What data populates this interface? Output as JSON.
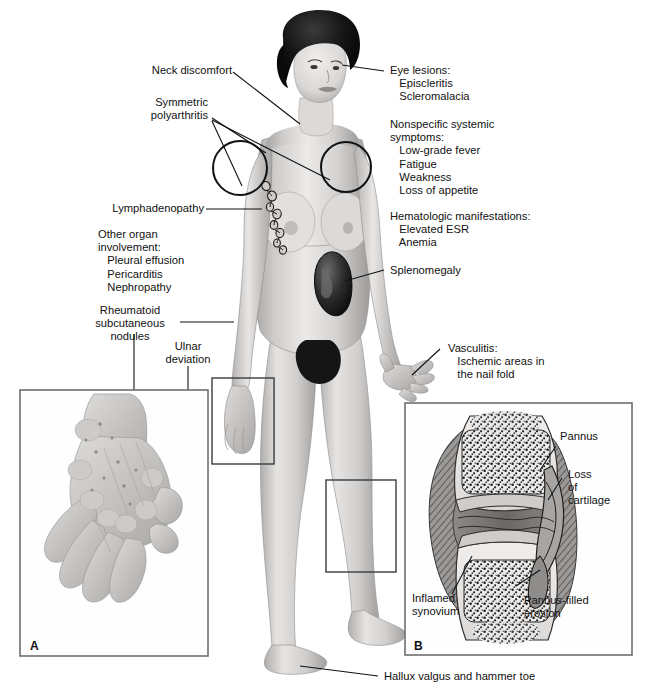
{
  "figure": {
    "background_color": "#ffffff",
    "line_color": "#111111",
    "skin_tone": "#d8d6d4"
  },
  "labels": {
    "neck_discomfort": "Neck discomfort",
    "symmetric_polyarthritis": "Symmetric\npolyarthritis",
    "lymphadenopathy": "Lymphadenopathy",
    "other_organ_involvement": "Other organ\ninvolvement:\n   Pleural effusion\n   Pericarditis\n   Nephropathy",
    "rheumatoid_nodules": "Rheumatoid\nsubcutaneous\nnodules",
    "ulnar_deviation": "Ulnar\ndeviation",
    "eye_lesions": "Eye lesions:\n   Episcleritis\n   Scleromalacia",
    "nonspecific_systemic": "Nonspecific systemic\nsymptoms:\n   Low-grade fever\n   Fatigue\n   Weakness\n   Loss of appetite",
    "hematologic": "Hematologic manifestations:\n   Elevated ESR\n   Anemia",
    "splenomegaly": "Splenomegaly",
    "vasculitis": "Vasculitis:\n   Ischemic areas in\n   the nail fold",
    "hallux_valgus": "Hallux valgus and hammer toe"
  },
  "panel_a": {
    "letter": "A",
    "content": "rheumatoid-hand-ulnar-deviation"
  },
  "panel_b": {
    "letter": "B",
    "content": "joint-cross-section-pannus",
    "labels": {
      "pannus": "Pannus",
      "loss_of_cartilage": "Loss\nof\ncartilage",
      "pannus_filled_erosion": "Pannus-filled\nerosion",
      "inflamed_synovium": "Inflamed\nsynovium"
    }
  }
}
